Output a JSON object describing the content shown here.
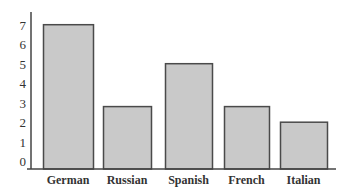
{
  "chart_data": {
    "type": "bar",
    "title": "",
    "xlabel": "",
    "ylabel": "",
    "categories": [
      "German",
      "Russian",
      "Spanish",
      "French",
      "Italian"
    ],
    "values": [
      7.4,
      3.2,
      5.4,
      3.2,
      2.4
    ],
    "yticks": [
      "0",
      "1",
      "2",
      "3",
      "4",
      "5",
      "6",
      "7"
    ],
    "ylim": [
      0,
      7.5
    ],
    "grid": false,
    "legend": null,
    "colors": {
      "bar_fill": "#c9c9c9",
      "bar_border": "#4a4a4a",
      "axis": "#444444"
    }
  }
}
